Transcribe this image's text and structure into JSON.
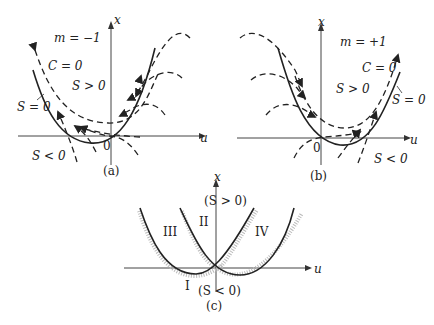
{
  "figure": {
    "panels": [
      {
        "id": "a",
        "caption": "(a)",
        "m_label": "m = −1",
        "curve_labels": {
          "dashed": "C = 0",
          "solid": "S = 0"
        },
        "region_labels": {
          "above": "S > 0",
          "below": "S < 0"
        },
        "axis_labels": {
          "x": "x",
          "u": "u",
          "origin": "0"
        }
      },
      {
        "id": "b",
        "caption": "(b)",
        "m_label": "m = +1",
        "curve_labels": {
          "dashed": "C = 0",
          "solid": "S = 0"
        },
        "region_labels": {
          "above": "S > 0",
          "below": "S < 0"
        },
        "axis_labels": {
          "x": "x",
          "u": "u",
          "origin": "0"
        }
      },
      {
        "id": "c",
        "caption": "(c)",
        "region_labels": {
          "I": "I",
          "II": "II",
          "III": "III",
          "IV": "IV"
        },
        "sign_labels": {
          "top": "(S > 0)",
          "bottom": "(S < 0)"
        },
        "axis_labels": {
          "x": "x",
          "u": "u"
        }
      }
    ]
  }
}
